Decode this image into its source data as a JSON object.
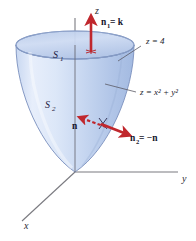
{
  "figure": {
    "background_color": "#ffffff"
  },
  "axes": {
    "z": {
      "label": "z",
      "x": 95,
      "y": 14
    },
    "y": {
      "label": "y",
      "x": 182,
      "y": 182
    },
    "x": {
      "label": "x",
      "x": 24,
      "y": 229
    },
    "origin": {
      "x": 75,
      "y": 172
    },
    "axis_color": "#7a7a80"
  },
  "surfaces": [
    {
      "name": "top-disk",
      "label": "S",
      "subscript": "1",
      "label_x": 53,
      "label_y": 58,
      "fill_color": "#c3d3ee",
      "edge_color": "#6f86b5"
    },
    {
      "name": "paraboloid-side",
      "label": "S",
      "subscript": "2",
      "label_x": 45,
      "label_y": 108,
      "fill_color": "#bdcfec",
      "edge_color": "#6f86b5"
    }
  ],
  "annotations": [
    {
      "name": "plane-equation",
      "text": "z = 4",
      "x": 146,
      "y": 42,
      "leader_from": {
        "x": 141,
        "y": 46
      },
      "leader_to": {
        "x": 118,
        "y": 61
      }
    },
    {
      "name": "paraboloid-equation",
      "text": "z = x² + y²",
      "x": 140,
      "y": 95,
      "leader_from": {
        "x": 136,
        "y": 92
      },
      "leader_to": {
        "x": 105,
        "y": 84
      }
    }
  ],
  "vectors": [
    {
      "name": "n1-upward-normal",
      "label": "n",
      "subscript": "1",
      "equals": " = k",
      "label_x": 101,
      "label_y": 24,
      "color": "#c0272d",
      "tail": {
        "x": 91,
        "y": 52
      },
      "head": {
        "x": 91,
        "y": 20
      }
    },
    {
      "name": "n-inward-normal",
      "label": "n",
      "subscript": "",
      "equals": "",
      "label_x": 74,
      "label_y": 128,
      "color": "#c0272d",
      "tail": {
        "x": 106,
        "y": 127
      },
      "head": {
        "x": 82,
        "y": 118
      },
      "dashed": true
    },
    {
      "name": "n2-outward-normal",
      "label": "n",
      "subscript": "2",
      "equals": " = −n",
      "label_x": 130,
      "label_y": 139,
      "color": "#c0272d",
      "tail": {
        "x": 101,
        "y": 124
      },
      "head": {
        "x": 126,
        "y": 134
      }
    }
  ],
  "colors": {
    "surface_light": "#dce6f7",
    "surface_mid": "#c3d3ee",
    "surface_dark": "#a9bfe3",
    "surface_edge": "#6f86b5",
    "arrow_red": "#c0272d",
    "axis_gray": "#7a7a80",
    "text_dark": "#1a1a2e"
  }
}
